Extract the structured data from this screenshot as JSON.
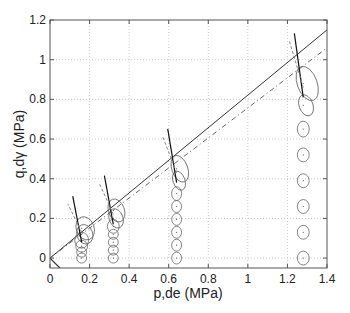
{
  "chart_data": {
    "type": "scatter",
    "title": "",
    "xlabel": "p,de (MPa)",
    "ylabel": "q,dγ (MPa)",
    "xlim": [
      0,
      1.4
    ],
    "ylim": [
      -0.05,
      1.2
    ],
    "xticks": [
      "0",
      "0.2",
      "0.4",
      "0.6",
      "0.8",
      "1",
      "1.2",
      "1.4"
    ],
    "yticks": [
      "0",
      "0.2",
      "0.4",
      "0.6",
      "0.8",
      "1",
      "1.2"
    ],
    "grid": true,
    "lines": [
      {
        "name": "solid failure line",
        "style": "solid",
        "x": [
          0,
          1.4
        ],
        "y": [
          0,
          1.15
        ]
      },
      {
        "name": "dashed failure line",
        "style": "dashdot",
        "x": [
          0,
          1.4
        ],
        "y": [
          0,
          1.06
        ]
      }
    ],
    "series": [
      {
        "name": "p=0.16",
        "x": 0.16,
        "y": [
          0,
          0.03,
          0.06,
          0.09,
          0.12,
          0.15
        ],
        "rx": [
          0.025,
          0.025,
          0.03,
          0.035,
          0.04,
          0.045
        ],
        "ry": [
          0.025,
          0.025,
          0.03,
          0.04,
          0.05,
          0.06
        ]
      },
      {
        "name": "p=0.32",
        "x": 0.32,
        "y": [
          0,
          0.04,
          0.08,
          0.12,
          0.16,
          0.2,
          0.24
        ],
        "rx": [
          0.025,
          0.025,
          0.025,
          0.025,
          0.03,
          0.035,
          0.04
        ],
        "ry": [
          0.025,
          0.025,
          0.025,
          0.025,
          0.035,
          0.05,
          0.06
        ]
      },
      {
        "name": "p=0.64",
        "x": 0.64,
        "y": [
          0,
          0.065,
          0.13,
          0.195,
          0.26,
          0.325,
          0.39,
          0.45
        ],
        "rx": [
          0.025,
          0.025,
          0.025,
          0.025,
          0.025,
          0.025,
          0.03,
          0.04
        ],
        "ry": [
          0.03,
          0.03,
          0.03,
          0.03,
          0.03,
          0.035,
          0.05,
          0.07
        ]
      },
      {
        "name": "p=1.28",
        "x": 1.28,
        "y": [
          0,
          0.13,
          0.26,
          0.39,
          0.52,
          0.65,
          0.77,
          0.88
        ],
        "rx": [
          0.03,
          0.03,
          0.03,
          0.03,
          0.03,
          0.03,
          0.035,
          0.05
        ],
        "ry": [
          0.035,
          0.035,
          0.035,
          0.035,
          0.035,
          0.04,
          0.055,
          0.09
        ]
      }
    ],
    "legend": []
  }
}
